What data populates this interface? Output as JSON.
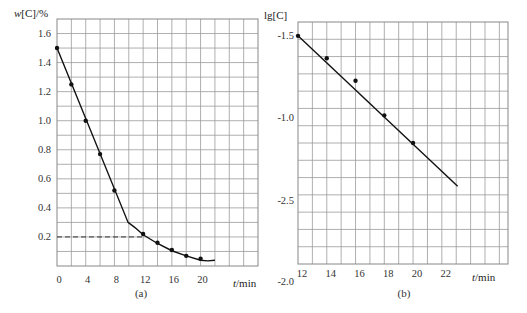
{
  "chart_data": [
    {
      "id": "a",
      "type": "line",
      "caption": "(a)",
      "ylabel": "w[C]/%",
      "ylabel_italic": "w",
      "ylabel_rest": "[C]/%",
      "xlabel": "t/min",
      "xlabel_italic": "t",
      "xlabel_rest": "/min",
      "xlim": [
        0,
        28
      ],
      "ylim": [
        0,
        1.7
      ],
      "grid": true,
      "x_grid_step": 2,
      "y_grid_step": 0.1,
      "x_ticks": [
        {
          "value": 0,
          "label": "0"
        },
        {
          "value": 4,
          "label": "4"
        },
        {
          "value": 8,
          "label": "8"
        },
        {
          "value": 12,
          "label": "12"
        },
        {
          "value": 16,
          "label": "16"
        },
        {
          "value": 20,
          "label": "20"
        }
      ],
      "y_ticks": [
        {
          "value": 0.2,
          "label": "0.2"
        },
        {
          "value": 0.4,
          "label": "0.4"
        },
        {
          "value": 0.6,
          "label": "0.6"
        },
        {
          "value": 0.8,
          "label": "0.8"
        },
        {
          "value": 1.0,
          "label": "1.0"
        },
        {
          "value": 1.2,
          "label": "1.2"
        },
        {
          "value": 1.4,
          "label": "1.4"
        },
        {
          "value": 1.6,
          "label": "1.6"
        }
      ],
      "points": {
        "x": [
          0,
          2,
          4,
          6,
          8,
          12,
          14,
          16,
          18,
          20
        ],
        "y": [
          1.5,
          1.25,
          1.0,
          0.77,
          0.52,
          0.22,
          0.16,
          0.11,
          0.07,
          0.05
        ]
      },
      "curve": {
        "x": [
          0,
          9.9,
          12,
          14,
          16,
          18,
          20,
          21,
          22
        ],
        "y": [
          1.5,
          0.3,
          0.215,
          0.155,
          0.105,
          0.07,
          0.04,
          0.035,
          0.04
        ]
      },
      "reference_line": {
        "y": 0.2,
        "x_from": 0,
        "x_to": 12,
        "style": "dashed"
      }
    },
    {
      "id": "b",
      "type": "line",
      "caption": "(b)",
      "ylabel": "lg[C]",
      "xlabel": "t/min",
      "xlabel_italic": "t",
      "xlabel_rest": "/min",
      "xlim": [
        12,
        26.6
      ],
      "y_grid_rows": 14,
      "grid": true,
      "x_grid_step": 1,
      "x_ticks": [
        {
          "value": 12,
          "label": "12"
        },
        {
          "value": 14,
          "label": "14"
        },
        {
          "value": 16,
          "label": "16"
        },
        {
          "value": 18,
          "label": "18"
        },
        {
          "value": 20,
          "label": "20"
        },
        {
          "value": 22,
          "label": "22"
        }
      ],
      "y_ticks": [
        {
          "pos": 0.8,
          "label": "-1.5"
        },
        {
          "pos": 5.5,
          "label": "-1.0"
        },
        {
          "pos": 10.3,
          "label": "-2.5"
        },
        {
          "pos": 15.0,
          "label": "-2.0"
        }
      ],
      "points": {
        "x": [
          12,
          14,
          16,
          18,
          20
        ],
        "y_grid_pos": [
          0.8,
          2.1,
          3.4,
          5.4,
          7.0
        ]
      },
      "fit_line": {
        "x": [
          12,
          23.1
        ],
        "y_grid_pos": [
          0.8,
          9.5
        ]
      }
    }
  ]
}
